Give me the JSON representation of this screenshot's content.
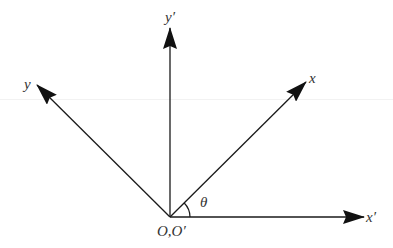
{
  "diagram": {
    "title": "",
    "origin_label": "O,O′",
    "angle_label": "θ",
    "axes": [
      {
        "id": "x_prime",
        "label": "x′",
        "direction": "0deg"
      },
      {
        "id": "y_prime",
        "label": "y′",
        "direction": "90deg"
      },
      {
        "id": "x",
        "label": "x",
        "direction": "θ (~45deg)"
      },
      {
        "id": "y",
        "label": "y",
        "direction": "θ+90deg (~135deg)"
      }
    ],
    "colors": {
      "stroke": "#1a1a1a",
      "label": "#333333",
      "background": "#ffffff"
    }
  },
  "labels": {
    "x_prime": "x′",
    "y_prime": "y′",
    "x": "x",
    "y": "y",
    "origin": "O,O′",
    "theta": "θ"
  }
}
